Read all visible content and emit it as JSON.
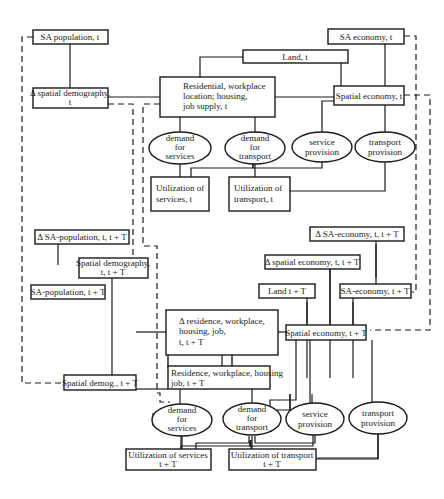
{
  "diagram": {
    "top": {
      "sa_population": "SA population, t",
      "delta_spatial_demography": [
        "Δ spatial demography,",
        "t"
      ],
      "residential_box": [
        "Residential, workplace",
        "location; housing,",
        "job supply, t"
      ],
      "land": "Land, t",
      "sa_economy": "SA economy, t",
      "spatial_economy": "Spatial economy, t",
      "demand_services": [
        "demand",
        "for",
        "services"
      ],
      "demand_transport": [
        "demand",
        "for",
        "transport"
      ],
      "service_provision": [
        "service",
        "provision"
      ],
      "transport_provision": [
        "transport",
        "provision"
      ],
      "util_services": [
        "Utilization of",
        "services, t"
      ],
      "util_transport": [
        "Utilization of",
        "transport, t"
      ]
    },
    "bottom": {
      "delta_sa_population": "Δ  SA-population, t, t + T",
      "spatial_demography_tT": [
        "Spatial demography,",
        "t, t + T"
      ],
      "sa_population_tT": "SA-population, t + T",
      "spatial_demog_tT": "Spatial demog., t + T",
      "delta_residence_box": [
        "Δ  residence, workplace,",
        "housing, job,",
        "t, t + T"
      ],
      "residence_tT": [
        "Residence, workplace, housing",
        "job, t + T"
      ],
      "delta_sa_economy": "Δ SA-economy, t, t + T",
      "delta_spatial_economy": "Δ spatial economy, t, t + T",
      "land_tT": "Land t + T",
      "sa_economy_tT": "SA-economy, t + T",
      "spatial_economy_tT": "Spatial economy, t + T",
      "demand_services": [
        "demand",
        "for",
        "services"
      ],
      "demand_transport": [
        "demand",
        "for",
        "transport"
      ],
      "service_provision": [
        "service",
        "provision"
      ],
      "transport_provision": [
        "transport",
        "provision"
      ],
      "util_services": [
        "Utilization of services",
        "t + T"
      ],
      "util_transport": [
        "Utilization of transport",
        "t + T"
      ]
    }
  }
}
